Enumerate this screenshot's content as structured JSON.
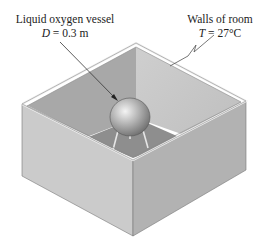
{
  "figure": {
    "vessel_label": {
      "title": "Liquid oxygen vessel",
      "symbol": "D",
      "value": " = 0.3 m"
    },
    "walls_label": {
      "title": "Walls of room",
      "symbol": "T",
      "value": " = 27°C"
    }
  },
  "colors": {
    "wall_outer_left": "#c9c9c9",
    "wall_outer_right": "#b4b4b4",
    "wall_inner_back_left": "#a9a9a9",
    "wall_inner_back_right": "#c4c4c4",
    "floor": "#9a9a9a",
    "rim": "#e8e8e8",
    "sphere": "#b0b0b0"
  }
}
